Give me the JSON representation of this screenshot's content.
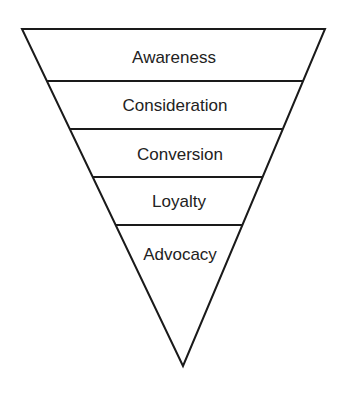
{
  "diagram": {
    "type": "inverted-funnel",
    "stroke_color": "#1a1a1a",
    "text_color": "#222222",
    "background": "#ffffff",
    "stages": [
      {
        "label": "Awareness"
      },
      {
        "label": "Consideration"
      },
      {
        "label": "Conversion"
      },
      {
        "label": "Loyalty"
      },
      {
        "label": "Advocacy"
      }
    ]
  }
}
